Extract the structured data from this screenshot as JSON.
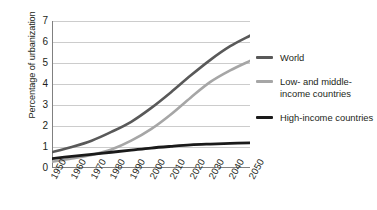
{
  "chart_data": {
    "type": "line",
    "title": "",
    "xlabel": "",
    "ylabel": "Percentage of urbanization",
    "xlim": [
      1950,
      2050
    ],
    "ylim": [
      0,
      7
    ],
    "yticks": [
      0,
      1,
      2,
      3,
      4,
      5,
      6,
      7
    ],
    "ytick_labels": [
      "0",
      "1",
      "2",
      "3",
      "4",
      "5",
      "6",
      "7"
    ],
    "x": [
      1950,
      1960,
      1970,
      1980,
      1990,
      2000,
      2010,
      2020,
      2030,
      2040,
      2050
    ],
    "xtick_labels": [
      "1950",
      "1960",
      "1970",
      "1980",
      "1990",
      "2000",
      "2010",
      "2020",
      "2030",
      "2040",
      "2050"
    ],
    "minor_tick_interval_years": 5,
    "grid": "horizontal",
    "legend_position": "right",
    "series": [
      {
        "name": "World",
        "color": "#595959",
        "width": 2.6,
        "values": [
          0.75,
          1.0,
          1.3,
          1.72,
          2.2,
          2.85,
          3.6,
          4.4,
          5.15,
          5.8,
          6.3
        ]
      },
      {
        "name": "Low- and middle-income countries",
        "color": "#a6a6a6",
        "width": 2.6,
        "values": [
          0.3,
          0.45,
          0.62,
          0.88,
          1.3,
          1.85,
          2.55,
          3.35,
          4.1,
          4.65,
          5.1
        ]
      },
      {
        "name": "High-income countries",
        "color": "#1a1a1a",
        "width": 2.8,
        "values": [
          0.45,
          0.55,
          0.65,
          0.75,
          0.85,
          0.95,
          1.03,
          1.1,
          1.14,
          1.17,
          1.2
        ]
      }
    ]
  },
  "legend": {
    "items": [
      {
        "label": "World"
      },
      {
        "label": "Low- and middle-income countries"
      },
      {
        "label": "High-income countries"
      }
    ]
  }
}
